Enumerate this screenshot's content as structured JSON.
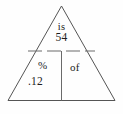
{
  "diagram": {
    "type": "percent-proportion-triangle",
    "shape": "triangle",
    "stroke_color": "#555555",
    "background_color": "#fefefe",
    "text_color": "#1d1d1d",
    "sections": {
      "top": {
        "label": "is",
        "value": "54"
      },
      "bottom_left": {
        "label": "%",
        "value": ".12"
      },
      "bottom_right": {
        "label": "of",
        "value": ""
      }
    },
    "dividers": {
      "horizontal": "dashed",
      "vertical": "solid"
    }
  }
}
